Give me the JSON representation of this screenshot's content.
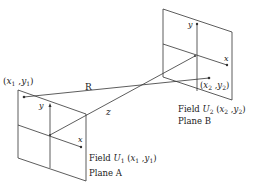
{
  "diagram": {
    "type": "propagation-geometry",
    "plane_a": {
      "field_label": "Field U",
      "field_sub": "1",
      "field_coords": "(x",
      "coord_label": "Field U1 (x1 ,y1)",
      "plane_label": "Plane A",
      "axis_x": "x",
      "axis_y": "y",
      "point_label": "(x1 ,y1)"
    },
    "plane_b": {
      "coord_label": "Field U2 (x2 ,y2)",
      "plane_label": "Plane B",
      "axis_x": "x",
      "axis_y": "y",
      "point_label": "(x2 ,y2)"
    },
    "distance_r": "R",
    "distance_z": "z",
    "colors": {
      "line": "#333333",
      "text": "#222222"
    }
  }
}
